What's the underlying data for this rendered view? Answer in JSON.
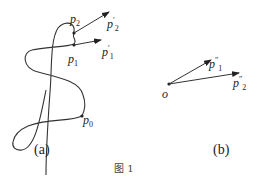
{
  "figure": {
    "caption": "图 1",
    "panel_a": {
      "label": "(a)",
      "points": {
        "p0": {
          "base": "p",
          "sub": "0",
          "sup": ""
        },
        "p1": {
          "base": "p",
          "sub": "1",
          "sup": ""
        },
        "p2": {
          "base": "p",
          "sub": "2",
          "sup": ""
        },
        "p1_prime": {
          "base": "p",
          "sub": "1",
          "sup": "′"
        },
        "p2_prime": {
          "base": "p",
          "sub": "2",
          "sup": "′"
        }
      }
    },
    "panel_b": {
      "label": "(b)",
      "origin": "o",
      "points": {
        "p1_dprime": {
          "base": "p",
          "sub": "1",
          "sup": "″"
        },
        "p2_dprime": {
          "base": "p",
          "sub": "2",
          "sup": "″"
        }
      }
    },
    "colors": {
      "stroke": "#333333",
      "text": "#222222"
    }
  }
}
